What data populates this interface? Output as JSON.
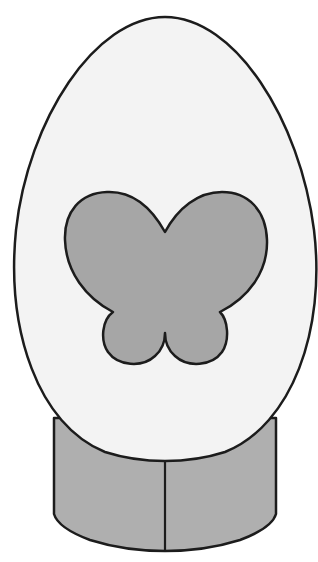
{
  "illustration": {
    "subject": "decorated egg on stand",
    "colors": {
      "background": "#ffffff",
      "egg_fill": "#f3f3f3",
      "butterfly_fill": "#a6a6a6",
      "stand_fill": "#afafaf",
      "outline": "#1c1c1c"
    },
    "parts": {
      "egg": "egg",
      "butterfly": "butterfly",
      "stand": "stand",
      "stand_divider": "stand-divider"
    }
  }
}
